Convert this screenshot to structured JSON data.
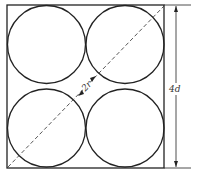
{
  "diagram": {
    "labels": {
      "diagonal": "2r",
      "side_dimension": "4d"
    },
    "colors": {
      "stroke": "#222222",
      "dashed": "#444444",
      "background": "#ffffff"
    }
  }
}
